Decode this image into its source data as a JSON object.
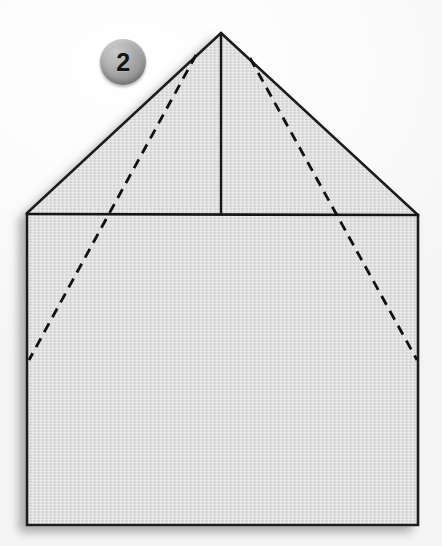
{
  "figure": {
    "kind": "origami-fold-diagram",
    "title": "Paper folding step 2",
    "step_badge": {
      "label": "2",
      "shape": "sphere",
      "color": "#9a9a9a",
      "text_color": "#141414",
      "center": [
        123,
        62
      ],
      "diameter": 46
    },
    "canvas": {
      "width": 442,
      "height": 546,
      "background_color": "#f7f7f7"
    },
    "paper": {
      "fill_color": "#dcdcdc",
      "fill_color_light": "#e6e6e6",
      "stroke_color": "#1a1a1a",
      "stroke_width": 2.6,
      "texture": "fine horizontal paper weave",
      "outline_points": "221,33 418,215 418,525 27,525 27,213",
      "shadow_color": "rgba(120,120,120,0.45)"
    },
    "solid_fold_lines": [
      {
        "name": "horizontal-fold",
        "x1": 27,
        "y1": 214,
        "x2": 418,
        "y2": 215
      },
      {
        "name": "vertical-center-fold",
        "x1": 221,
        "y1": 34,
        "x2": 221,
        "y2": 214
      }
    ],
    "dashed_fold_lines": [
      {
        "name": "left-diagonal-fold",
        "x1": 196,
        "y1": 55,
        "x2": 29,
        "y2": 360,
        "dash": "10 7"
      },
      {
        "name": "right-diagonal-fold",
        "x1": 250,
        "y1": 58,
        "x2": 417,
        "y2": 360,
        "dash": "10 7"
      }
    ]
  }
}
